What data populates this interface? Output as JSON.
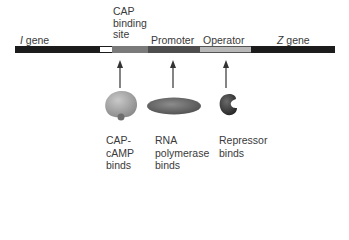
{
  "diagram": {
    "labels": {
      "i_gene_letter": "I",
      "i_gene_word": " gene",
      "cap_site_line1": "CAP",
      "cap_site_line2": "binding",
      "cap_site_line3": "site",
      "promoter": "Promoter",
      "operator": "Operator",
      "z_gene_letter": "Z",
      "z_gene_word": " gene"
    },
    "segments": [
      {
        "name": "I gene",
        "color": "#1c1c1c"
      },
      {
        "name": "spacer",
        "color": "#ffffff"
      },
      {
        "name": "CAP binding site",
        "color": "#7a7a7a"
      },
      {
        "name": "Promoter",
        "color": "#4e4e4e"
      },
      {
        "name": "Operator",
        "color": "#b8b8b8"
      },
      {
        "name": "Z gene",
        "color": "#1c1c1c"
      }
    ],
    "binders": [
      {
        "name": "CAP-cAMP",
        "line1": "CAP-",
        "line2": "cAMP",
        "line3": "binds",
        "icon": "cap-camp-protein"
      },
      {
        "name": "RNA polymerase",
        "line1": "RNA",
        "line2": "polymerase",
        "line3": "binds",
        "icon": "rna-polymerase-protein"
      },
      {
        "name": "Repressor",
        "line1": "Repressor",
        "line2": "binds",
        "icon": "repressor-protein"
      }
    ]
  }
}
